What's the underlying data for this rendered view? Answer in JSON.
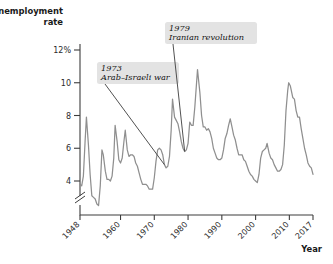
{
  "chart_data": {
    "type": "line",
    "title": "",
    "ylabel": "Unemployment rate",
    "xlabel": "Year",
    "ylim": [
      2.0,
      12.8
    ],
    "xlim": [
      1948,
      2017
    ],
    "grid": false,
    "legend": "none",
    "axis_break": true,
    "axis_break_note": "y-axis broken below 4%",
    "ytick_labels": [
      "12%",
      "10",
      "8",
      "6",
      "4"
    ],
    "ytick_values": [
      12,
      10,
      8,
      6,
      4
    ],
    "xtick_labels": [
      "1948",
      "1960",
      "1970",
      "1980",
      "1990",
      "2000",
      "2010",
      "2017"
    ],
    "xtick_values": [
      1948,
      1960,
      1970,
      1980,
      1990,
      2000,
      2010,
      2017
    ],
    "series_name": "Unemployment rate",
    "line_color": "#8f8f8f",
    "x": [
      1948,
      1948.5,
      1949,
      1949.5,
      1949.9,
      1950.5,
      1951,
      1951.5,
      1952,
      1952.5,
      1953,
      1953.5,
      1954,
      1954.5,
      1954.9,
      1955.5,
      1956,
      1956.5,
      1957,
      1957.5,
      1958,
      1958.4,
      1959,
      1959.5,
      1960,
      1960.5,
      1961,
      1961.4,
      1962,
      1962.5,
      1963,
      1963.5,
      1964,
      1964.5,
      1965,
      1965.5,
      1966,
      1966.5,
      1967,
      1967.5,
      1968,
      1968.5,
      1969,
      1969.5,
      1970,
      1970.5,
      1971,
      1971.5,
      1972,
      1972.5,
      1973,
      1973.5,
      1974,
      1974.5,
      1975,
      1975.4,
      1976,
      1976.5,
      1977,
      1977.5,
      1978,
      1978.5,
      1979,
      1979.5,
      1980,
      1980.5,
      1981,
      1981.5,
      1982,
      1982.8,
      1983,
      1983.5,
      1984,
      1984.5,
      1985,
      1985.5,
      1986,
      1986.5,
      1987,
      1987.5,
      1988,
      1988.5,
      1989,
      1989.5,
      1990,
      1990.5,
      1991,
      1991.5,
      1992,
      1992.5,
      1993,
      1993.5,
      1994,
      1994.5,
      1995,
      1995.5,
      1996,
      1996.5,
      1997,
      1997.5,
      1998,
      1998.5,
      1999,
      1999.5,
      2000,
      2000.5,
      2001,
      2001.5,
      2002,
      2002.5,
      2003,
      2003.4,
      2004,
      2004.5,
      2005,
      2005.5,
      2006,
      2006.5,
      2007,
      2007.5,
      2008,
      2008.5,
      2009,
      2009.5,
      2009.8,
      2010.3,
      2011,
      2011.5,
      2012,
      2012.5,
      2013,
      2013.5,
      2014,
      2014.5,
      2015,
      2015.5,
      2016,
      2016.5,
      2017
    ],
    "y": [
      3.8,
      3.7,
      4.3,
      6.4,
      7.9,
      6.2,
      4.4,
      3.1,
      3.0,
      2.9,
      2.6,
      2.5,
      3.7,
      5.9,
      5.6,
      4.6,
      4.1,
      4.1,
      4.0,
      4.3,
      5.4,
      7.4,
      6.4,
      5.3,
      5.1,
      5.4,
      6.4,
      7.1,
      5.9,
      5.5,
      5.6,
      5.6,
      5.5,
      5.1,
      4.9,
      4.5,
      4.1,
      3.8,
      3.8,
      3.8,
      3.7,
      3.5,
      3.5,
      3.5,
      4.2,
      5.2,
      5.9,
      6.0,
      5.9,
      5.6,
      5.0,
      4.8,
      4.9,
      5.5,
      7.1,
      9.0,
      7.9,
      7.7,
      7.5,
      7.0,
      6.4,
      6.0,
      5.8,
      5.9,
      6.3,
      7.6,
      7.4,
      7.4,
      8.5,
      10.8,
      10.4,
      9.4,
      8.0,
      7.3,
      7.3,
      7.1,
      7.2,
      7.0,
      6.6,
      6.0,
      5.7,
      5.4,
      5.3,
      5.3,
      5.4,
      5.9,
      6.6,
      6.9,
      7.4,
      7.8,
      7.3,
      6.8,
      6.5,
      6.0,
      5.6,
      5.6,
      5.6,
      5.3,
      5.2,
      4.9,
      4.6,
      4.4,
      4.3,
      4.1,
      4.0,
      3.9,
      4.4,
      5.4,
      5.8,
      5.9,
      6.0,
      6.3,
      5.7,
      5.4,
      5.3,
      5.0,
      4.8,
      4.6,
      4.6,
      4.7,
      5.0,
      6.2,
      8.3,
      9.5,
      10.0,
      9.8,
      9.1,
      9.0,
      8.3,
      7.9,
      7.9,
      7.2,
      6.6,
      6.0,
      5.6,
      5.1,
      4.9,
      4.8,
      4.4
    ],
    "annotations": [
      {
        "id": "annotation-1973",
        "year": "1973",
        "event": "Arab–Israeli war",
        "target_year": 1973,
        "target_value": 5.0,
        "leader": "diagonal"
      },
      {
        "id": "annotation-1979",
        "year": "1979",
        "event": "Iranian revolution",
        "target_year": 1979,
        "target_value": 5.8,
        "leader": "vertical"
      }
    ]
  },
  "labels": {
    "y_axis_title_line1": "Unemployment",
    "y_axis_title_line2": "rate",
    "x_axis_title": "Year"
  }
}
